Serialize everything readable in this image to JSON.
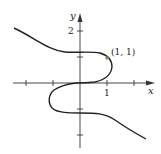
{
  "figure": {
    "type": "curve-plot",
    "axes": {
      "x_label": "x",
      "y_label": "y",
      "x_tick_label": "1",
      "y_tick_label": "2",
      "x_ticks": [
        -2,
        -1,
        1,
        2
      ],
      "y_ticks": [
        -2,
        -1,
        1,
        2
      ]
    },
    "point": {
      "label": "(1, 1)",
      "x": 1,
      "y": 1
    },
    "colors": {
      "curve": "#222222",
      "axis": "#333333",
      "point": "#888888"
    }
  }
}
